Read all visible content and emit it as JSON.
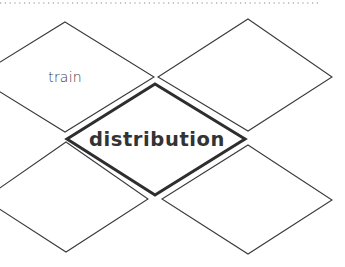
{
  "diagram": {
    "top_border": {
      "style": "dotted",
      "color": "#8a8a8a",
      "x1": 0,
      "x2": 320,
      "y": 3
    },
    "nodes": [
      {
        "id": "top-left",
        "label": "train",
        "style": "thin",
        "points": "65,22 154,77 65,132 -24,77",
        "label_x": 65,
        "label_y": 82
      },
      {
        "id": "upper-right",
        "label": "",
        "style": "thin",
        "points": "248,19 332,77 248,131 158,77"
      },
      {
        "id": "center",
        "label": "distribution",
        "style": "thick",
        "points": "155,84 245,139 155,195 67,139",
        "label_x": 157,
        "label_y": 146
      },
      {
        "id": "lower-left",
        "label": "",
        "style": "thin",
        "points": "66,142 148,199 66,252 -16,199"
      },
      {
        "id": "lower-right",
        "label": "",
        "style": "thin",
        "points": "248,145 332,200 248,254 162,199"
      }
    ]
  }
}
